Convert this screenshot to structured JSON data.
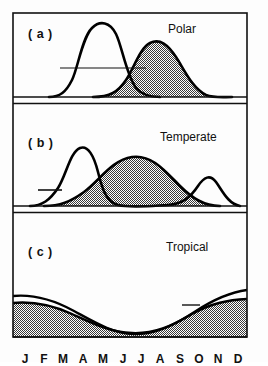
{
  "figure": {
    "frame_color": "#111111",
    "hatch_color": "#2b2b2b",
    "curve_color": "#000000",
    "background": "#fdfdfd"
  },
  "panels": [
    {
      "tag": "( a )",
      "title": "Polar",
      "tag_x": 28,
      "tag_y": 27,
      "title_x": 168,
      "title_y": 22
    },
    {
      "tag": "( b )",
      "title": "Temperate",
      "tag_x": 28,
      "tag_y": 136,
      "title_x": 160,
      "title_y": 130
    },
    {
      "tag": "( c )",
      "title": "Tropical",
      "tag_x": 28,
      "tag_y": 245,
      "title_x": 166,
      "title_y": 240
    }
  ],
  "axis": {
    "label": "",
    "months": [
      "J",
      "F",
      "M",
      "A",
      "M",
      "J",
      "J",
      "A",
      "S",
      "O",
      "N",
      "D"
    ],
    "month_x": [
      25,
      44,
      63,
      83,
      103,
      123,
      141,
      160,
      180,
      199,
      218,
      238
    ],
    "month_y": 352
  },
  "chart_data": {
    "type": "area",
    "xlabel": "",
    "ylabel": "",
    "categories": [
      "J",
      "F",
      "M",
      "A",
      "M",
      "J",
      "J",
      "A",
      "S",
      "O",
      "N",
      "D"
    ],
    "grid": false,
    "legend_position": "none",
    "panels": [
      {
        "label": "( a )",
        "name": "Polar",
        "series": [
          {
            "name": "unfilled-curve",
            "fill": "none",
            "values": [
              0,
              0,
              2,
              20,
              62,
              88,
              72,
              34,
              10,
              2,
              0,
              0
            ]
          },
          {
            "name": "hatched-curve",
            "fill": "hatch",
            "values": [
              0,
              0,
              0,
              1,
              5,
              20,
              48,
              66,
              60,
              34,
              10,
              2
            ]
          }
        ],
        "annotations": [
          {
            "type": "horizontal-connector",
            "x_from": 60,
            "x_to": 146,
            "y": 68
          }
        ]
      },
      {
        "label": "( b )",
        "name": "Temperate",
        "series": [
          {
            "name": "unfilled-curve",
            "fill": "none",
            "values": [
              0,
              3,
              20,
              58,
              30,
              12,
              8,
              6,
              8,
              20,
              14,
              3
            ]
          },
          {
            "name": "hatched-curve",
            "fill": "hatch",
            "values": [
              0,
              1,
              5,
              16,
              32,
              44,
              48,
              44,
              32,
              16,
              5,
              1
            ]
          }
        ],
        "annotations": [
          {
            "type": "tick-mark",
            "x_from": 38,
            "x_to": 62,
            "y": 190
          }
        ]
      },
      {
        "label": "( c )",
        "name": "Tropical",
        "series": [
          {
            "name": "upper-curve",
            "fill": "none",
            "values": [
              24,
              25,
              23,
              18,
              12,
              8,
              7,
              8,
              13,
              19,
              24,
              27
            ]
          },
          {
            "name": "hatched-curve",
            "fill": "hatch",
            "values": [
              19,
              20,
              19,
              15,
              10,
              7,
              6,
              7,
              11,
              15,
              18,
              20
            ]
          }
        ],
        "annotations": [
          {
            "type": "tick-mark",
            "x_from": 182,
            "x_to": 200,
            "y": 305
          }
        ]
      }
    ]
  }
}
